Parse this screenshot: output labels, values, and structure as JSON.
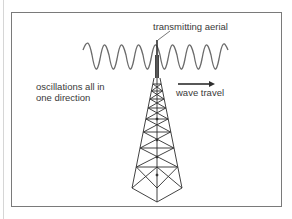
{
  "diagram": {
    "labels": {
      "aerial": "transmitting aerial",
      "oscillations_line1": "oscillations all in",
      "oscillations_line2": "one direction",
      "travel": "wave travel"
    },
    "colors": {
      "frame": "#7a7a7a",
      "wave": "#6a6a6a",
      "tower": "#2e2e2e",
      "text": "#3a3a3a"
    },
    "elements": [
      "transverse-wave",
      "transmission-tower",
      "direction-arrow",
      "leader-line"
    ]
  }
}
